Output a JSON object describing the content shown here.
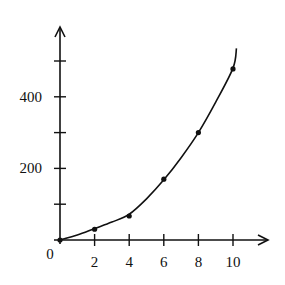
{
  "chart_data": {
    "type": "scatter",
    "title": "",
    "xlabel": "",
    "ylabel": "",
    "origin_label": "0",
    "x_ticks": [
      2,
      4,
      6,
      8,
      10
    ],
    "x_tick_labels": [
      "2",
      "4",
      "6",
      "8",
      "10"
    ],
    "y_ticks": [
      100,
      200,
      300,
      400,
      500
    ],
    "y_tick_labels": [
      "",
      "200",
      "",
      "400",
      ""
    ],
    "xlim": [
      0,
      12
    ],
    "ylim": [
      0,
      590
    ],
    "grid": false,
    "legend": null,
    "series": [
      {
        "name": "data points",
        "kind": "scatter",
        "x": [
          0,
          2,
          4,
          6,
          8,
          10
        ],
        "y": [
          0,
          30,
          67,
          170,
          300,
          478
        ]
      },
      {
        "name": "fitted curve",
        "kind": "line",
        "x": [
          0,
          1,
          2,
          3,
          4,
          5,
          6,
          7,
          8,
          9,
          10,
          10.2
        ],
        "y": [
          0,
          14,
          32,
          50,
          72,
          115,
          168,
          230,
          300,
          385,
          480,
          535
        ]
      }
    ],
    "colors": {
      "ink": "#111111",
      "background": "#ffffff"
    }
  }
}
